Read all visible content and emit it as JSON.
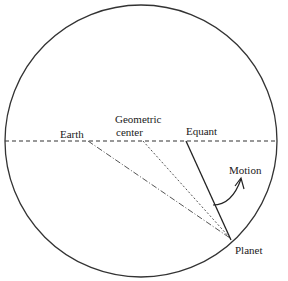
{
  "diagram": {
    "labels": {
      "earth": "Earth",
      "geometric_center_line1": "Geometric",
      "geometric_center_line2": "center",
      "equant": "Equant",
      "motion": "Motion",
      "planet": "Planet"
    },
    "colors": {
      "stroke": "#333333",
      "background": "#ffffff"
    },
    "points": {
      "earth": [
        88,
        141
      ],
      "geometric_center": [
        143,
        141
      ],
      "equant": [
        186,
        141
      ],
      "planet": [
        231,
        240
      ]
    },
    "circle": {
      "cx": 141,
      "cy": 141,
      "r": 136
    }
  }
}
